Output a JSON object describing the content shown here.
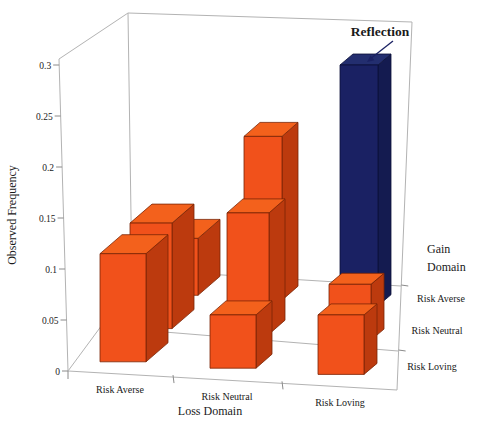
{
  "chart_data": {
    "type": "bar",
    "variant": "3d-column",
    "title": "",
    "ylabel": "Observed Frequency",
    "xlabel": "Loss Domain",
    "zlabel": "Gain Domain",
    "x_categories": [
      "Risk Averse",
      "Risk Neutral",
      "Risk Loving"
    ],
    "z_categories": [
      "Risk Averse",
      "Risk Neutral",
      "Risk Loving"
    ],
    "y_tick_labels": [
      "0",
      "0.05",
      "0.1",
      "0.15",
      "0.2",
      "0.25",
      "0.3"
    ],
    "y_tick_values": [
      0,
      0.05,
      0.1,
      0.15,
      0.2,
      0.25,
      0.3
    ],
    "ylim": [
      0,
      0.3
    ],
    "grid": "floor-row-lines-only",
    "legend": "none",
    "series": [
      {
        "name": "Gain: Risk Averse",
        "depth": "back",
        "values": [
          0.13,
          0.23,
          0.3
        ]
      },
      {
        "name": "Gain: Risk Neutral",
        "depth": "middle",
        "values": [
          0.145,
          0.155,
          0.085
        ]
      },
      {
        "name": "Gain: Risk Loving",
        "depth": "front",
        "values": [
          0.115,
          0.055,
          0.055
        ]
      }
    ],
    "annotation": {
      "label": "Reflection",
      "target": {
        "loss": "Risk Loving",
        "gain": "Risk Averse"
      },
      "value": 0.3
    },
    "colors": {
      "bar_front": "#f1511b",
      "bar_side": "#bc3a0e",
      "bar_top": "#f3611c",
      "bar_outline": "#7a2405",
      "highlight_front": "#1a2163",
      "highlight_side": "#141b50",
      "highlight_top": "#232e6f",
      "highlight_outline": "#0b1038",
      "annotation_text": "#1a2163",
      "wireframe": "#b3b3b3",
      "text": "#1a1a1a"
    }
  }
}
